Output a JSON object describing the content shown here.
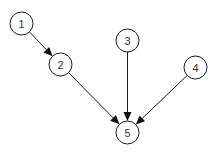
{
  "diagram": {
    "type": "directed-graph",
    "background": "#ffffff",
    "stroke_color": "#1a1a1a",
    "node_radius": 11.5,
    "nodes": [
      {
        "id": "1",
        "label": "1",
        "cx": 21.5,
        "cy": 23.5
      },
      {
        "id": "2",
        "label": "2",
        "cx": 60.5,
        "cy": 64.5
      },
      {
        "id": "3",
        "label": "3",
        "cx": 127.5,
        "cy": 40.5
      },
      {
        "id": "4",
        "label": "4",
        "cx": 195.5,
        "cy": 67.5
      },
      {
        "id": "5",
        "label": "5",
        "cx": 127.5,
        "cy": 132.5
      }
    ],
    "edges": [
      {
        "from": "1",
        "to": "2"
      },
      {
        "from": "2",
        "to": "5"
      },
      {
        "from": "3",
        "to": "5"
      },
      {
        "from": "4",
        "to": "5"
      }
    ]
  }
}
